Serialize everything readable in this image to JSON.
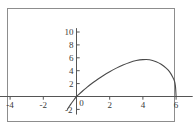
{
  "chart_data": {
    "type": "line",
    "title": "",
    "subtitle": "",
    "xlabel": "",
    "ylabel": "",
    "xlim": [
      -5,
      7
    ],
    "ylim": [
      -2.8,
      10.6
    ],
    "xticks": [
      -4,
      -2,
      0,
      2,
      4,
      6
    ],
    "yticks": [
      -2,
      2,
      4,
      6,
      8,
      10
    ],
    "xtick_labels": [
      "-4",
      "-2",
      "0",
      "2",
      "4",
      "6"
    ],
    "ytick_labels": [
      "-2",
      "2",
      "4",
      "6",
      "8",
      "10"
    ],
    "origin_label": "0",
    "grid": false,
    "legend": null,
    "series": [
      {
        "name": "curve",
        "color": "#4a4a4a",
        "x": [
          -0.55,
          -0.45,
          -0.35,
          -0.25,
          -0.15,
          0,
          0.2,
          0.4,
          0.6,
          0.8,
          1.0,
          1.3,
          1.6,
          2.0,
          2.4,
          2.8,
          3.2,
          3.6,
          4.0,
          4.4,
          4.8,
          5.1,
          5.4,
          5.6,
          5.8,
          5.9,
          5.96,
          6.0
        ],
        "y": [
          -2.0,
          -1.6,
          -1.22,
          -0.85,
          -0.5,
          0,
          0.47,
          0.93,
          1.36,
          1.78,
          2.17,
          2.72,
          3.23,
          3.85,
          4.4,
          4.88,
          5.28,
          5.57,
          5.72,
          5.7,
          5.4,
          5.0,
          4.4,
          3.85,
          3.0,
          2.4,
          1.6,
          0
        ]
      }
    ],
    "annotations": []
  },
  "figure": {
    "background_color": "#ffffff",
    "frame_color": "#8d8d8d",
    "axis_color": "#555555",
    "curve_color": "#4a4a4a",
    "label_color": "#3a3a3a"
  }
}
